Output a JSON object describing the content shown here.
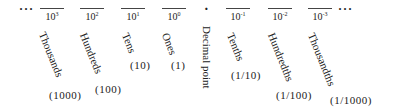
{
  "ellipsis": "···",
  "decimal_dot": "·",
  "places": [
    {
      "base": "10",
      "exp": "3",
      "name": "Thousands",
      "value": "(1000)"
    },
    {
      "base": "10",
      "exp": "2",
      "name": "Hundreds",
      "value": "(100)"
    },
    {
      "base": "10",
      "exp": "1",
      "name": "Tens",
      "value": "(10)"
    },
    {
      "base": "10",
      "exp": "0",
      "name": "Ones",
      "value": "(1)"
    },
    {
      "base": "10",
      "exp": "-1",
      "name": "Tenths",
      "value": "(1/10)"
    },
    {
      "base": "10",
      "exp": "-2",
      "name": "Hundredths",
      "value": "(1/100)"
    },
    {
      "base": "10",
      "exp": "-3",
      "name": "Thousandths",
      "value": "(1/1000)"
    }
  ],
  "decimal_point_label": "Decimal point"
}
